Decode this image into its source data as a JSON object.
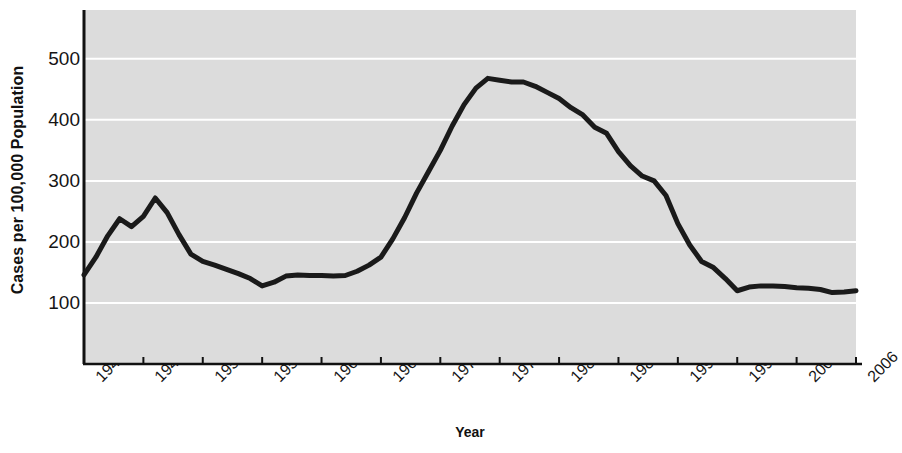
{
  "chart_data": {
    "type": "line",
    "title": "",
    "xlabel": "Year",
    "ylabel": "Cases per 100,000 Population",
    "xlim": [
      1941,
      2006
    ],
    "ylim": [
      0,
      580
    ],
    "yticks": [
      100,
      200,
      300,
      400,
      500
    ],
    "ytick_labels": [
      "100",
      "200",
      "300",
      "400",
      "500"
    ],
    "xticks": [
      1941,
      1946,
      1951,
      1956,
      1961,
      1966,
      1971,
      1976,
      1981,
      1986,
      1991,
      1996,
      2001,
      2006
    ],
    "xtick_labels": [
      "1941",
      "1946",
      "1951",
      "1956",
      "1961",
      "1966",
      "1971",
      "1976",
      "1981",
      "1986",
      "1991",
      "1996",
      "2001",
      "2006"
    ],
    "grid": "horizontal",
    "legend": "none",
    "line_color": "#1a1a1a",
    "plot_background": "#dcdcdc",
    "gridline_color": "#ffffff",
    "x": [
      1941,
      1942,
      1943,
      1944,
      1945,
      1946,
      1947,
      1948,
      1949,
      1950,
      1951,
      1952,
      1953,
      1954,
      1955,
      1956,
      1957,
      1958,
      1959,
      1960,
      1961,
      1962,
      1963,
      1964,
      1965,
      1966,
      1967,
      1968,
      1969,
      1970,
      1971,
      1972,
      1973,
      1974,
      1975,
      1976,
      1977,
      1978,
      1979,
      1980,
      1981,
      1982,
      1983,
      1984,
      1985,
      1986,
      1987,
      1988,
      1989,
      1990,
      1991,
      1992,
      1993,
      1994,
      1995,
      1996,
      1997,
      1998,
      1999,
      2000,
      2001,
      2002,
      2003,
      2004,
      2005,
      2006
    ],
    "values": [
      146,
      175,
      210,
      238,
      225,
      242,
      272,
      248,
      212,
      180,
      168,
      162,
      155,
      148,
      140,
      128,
      134,
      144,
      146,
      145,
      145,
      144,
      145,
      152,
      162,
      175,
      205,
      240,
      280,
      315,
      350,
      390,
      425,
      452,
      468,
      465,
      462,
      462,
      455,
      445,
      435,
      420,
      408,
      388,
      378,
      348,
      325,
      308,
      300,
      276,
      230,
      195,
      168,
      158,
      140,
      120,
      126,
      128,
      128,
      127,
      125,
      124,
      122,
      117,
      118,
      120
    ],
    "series_name": "Cases per 100,000 Population"
  }
}
